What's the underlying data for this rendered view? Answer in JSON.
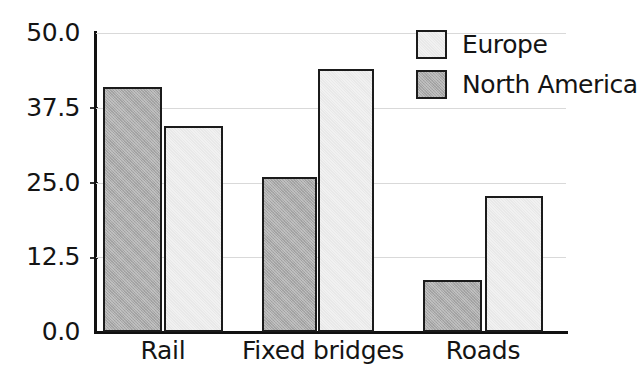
{
  "chart_data": {
    "type": "bar",
    "title": "",
    "subtitle": "",
    "xlabel": "",
    "ylabel": "",
    "categories": [
      "Rail",
      "Fixed bridges",
      "Roads"
    ],
    "series": [
      {
        "name": "North America",
        "values": [
          41.0,
          26.0,
          8.7
        ],
        "color": "#a9a9a9"
      },
      {
        "name": "Europe",
        "values": [
          34.5,
          44.0,
          22.7
        ],
        "color": "#f1f1f1"
      }
    ],
    "series_draw_order": [
      "North America",
      "Europe"
    ],
    "ylim": [
      0.0,
      50.0
    ],
    "yticks": [
      0.0,
      12.5,
      25.0,
      37.5,
      50.0
    ],
    "ytick_labels": [
      "0.0",
      "12.5",
      "25.0",
      "37.5",
      "50.0"
    ],
    "grid": true,
    "grid_axis": "y",
    "legend_position": "top-right",
    "legend_entries": [
      "Europe",
      "North America"
    ],
    "bar_edge_color": "#1b1b1b",
    "background_color": "#ffffff"
  },
  "legend": {
    "items": [
      {
        "label": "Europe",
        "swatch": "eu"
      },
      {
        "label": "North America",
        "swatch": "na"
      }
    ]
  },
  "axis": {
    "y_labels": [
      "50.0",
      "37.5",
      "25.0",
      "12.5",
      "0.0"
    ],
    "x_labels": [
      "Rail",
      "Fixed bridges",
      "Roads"
    ]
  }
}
